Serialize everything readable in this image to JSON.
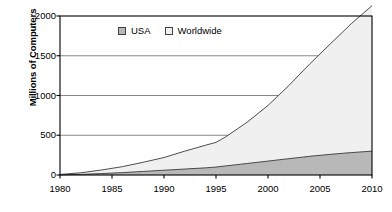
{
  "chart_data": {
    "type": "area",
    "title": "",
    "subtitle": "",
    "xlabel": "",
    "ylabel": "Millions of Computers",
    "stacked": true,
    "grid": true,
    "legend_position": "top-center-inside",
    "xlim": [
      1980,
      2010
    ],
    "ylim": [
      0,
      2000
    ],
    "xticks": [
      1980,
      1985,
      1990,
      1995,
      2000,
      2005,
      2010
    ],
    "yticks": [
      0,
      500,
      1000,
      1500,
      2000
    ],
    "x": [
      1980,
      1982,
      1984,
      1986,
      1988,
      1990,
      1992,
      1994,
      1995,
      1996,
      1998,
      2000,
      2002,
      2004,
      2006,
      2008,
      2010
    ],
    "series": [
      {
        "name": "USA",
        "color": "#b8b8b8",
        "values": [
          2,
          8,
          18,
          30,
          45,
          60,
          75,
          90,
          100,
          115,
          145,
          175,
          205,
          235,
          260,
          282,
          300
        ]
      },
      {
        "name": "Worldwide",
        "color": "#f0f0f0",
        "values": [
          5,
          20,
          45,
          75,
          115,
          160,
          225,
          285,
          310,
          370,
          520,
          700,
          920,
          1160,
          1390,
          1620,
          1830
        ]
      }
    ],
    "annotations": []
  },
  "axis": {
    "y_title": "Millions of Computers",
    "y_tick_labels": [
      "2000",
      "1500",
      "1000",
      "500",
      "0"
    ],
    "x_tick_labels": [
      "1980",
      "1985",
      "1990",
      "1995",
      "2000",
      "2005",
      "2010"
    ]
  },
  "legend": {
    "items": [
      {
        "label": "USA",
        "color": "#b8b8b8"
      },
      {
        "label": "Worldwide",
        "color": "#f0f0f0"
      }
    ]
  },
  "colors": {
    "usa_fill": "#b8b8b8",
    "worldwide_fill": "#f0f0f0",
    "line": "#3a3a3a",
    "axis": "#000000",
    "grid": "#7a7a7a",
    "background": "#ffffff"
  }
}
